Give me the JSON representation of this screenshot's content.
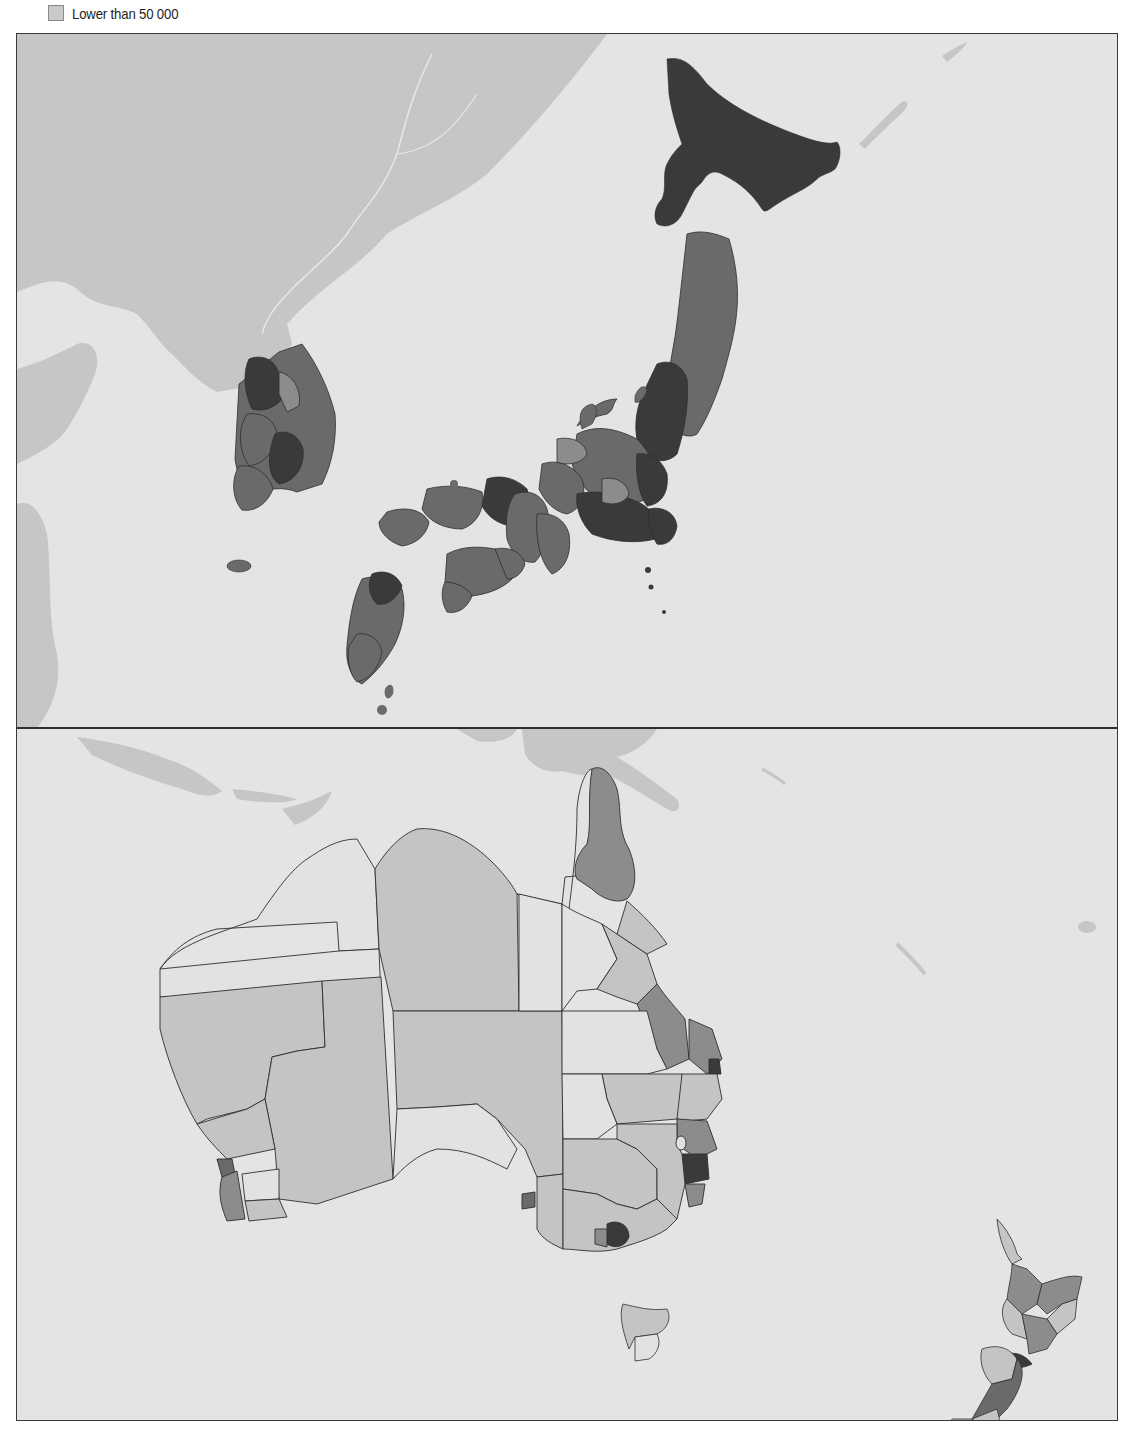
{
  "legend": {
    "items": [
      {
        "label": "Lower than 50 000",
        "color": "#c9c9c9"
      }
    ]
  },
  "palette": {
    "sea": "#e4e4e4",
    "other_land": "#c6c6c6",
    "border": "#2f2f2f",
    "class_1_lowest": "#e2e2e2",
    "class_2": "#c4c4c4",
    "class_3": "#8c8c8c",
    "class_4": "#6a6a6a",
    "class_5_highest": "#3a3a3a"
  },
  "maps": [
    {
      "id": "north_asia",
      "regions_shown": [
        "Japan",
        "Korea"
      ]
    },
    {
      "id": "oceania",
      "regions_shown": [
        "Australia",
        "New Zealand"
      ]
    }
  ]
}
